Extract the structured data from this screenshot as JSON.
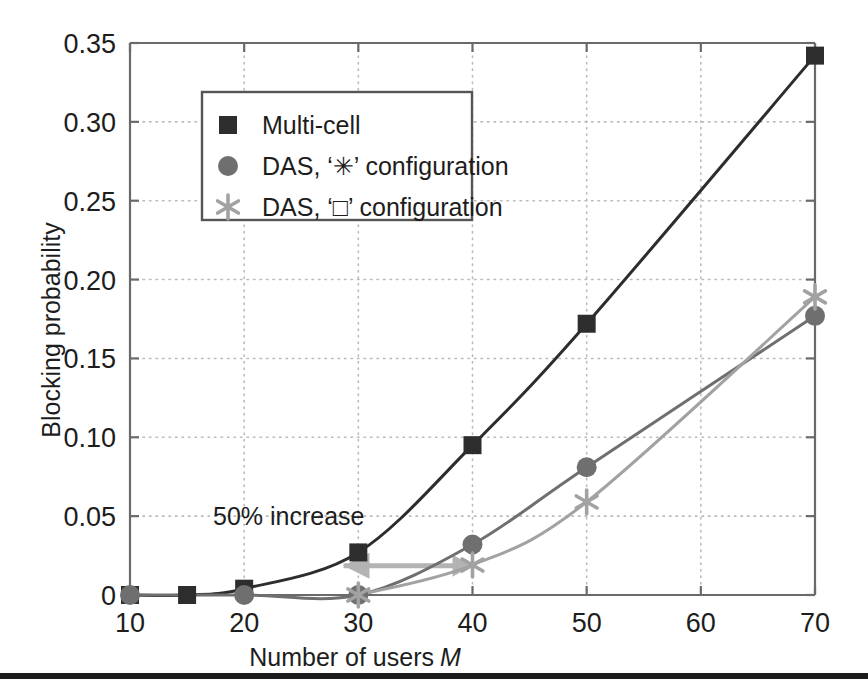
{
  "chart_data": {
    "type": "line",
    "title": "",
    "subtitle": "",
    "xlabel": "Number of users",
    "xlabel_symbol": "M",
    "ylabel": "Blocking probability",
    "xlim": [
      10,
      70
    ],
    "ylim": [
      0,
      0.35
    ],
    "grid": true,
    "grid_style": "dotted",
    "x_ticks": [
      10,
      20,
      30,
      40,
      50,
      60,
      70
    ],
    "x_tick_labels": [
      "10",
      "20",
      "30",
      "40",
      "50",
      "60",
      "70"
    ],
    "y_ticks": [
      0,
      0.05,
      0.1,
      0.15,
      0.2,
      0.25,
      0.3,
      0.35
    ],
    "y_tick_labels": [
      "0",
      "0.05",
      "0.10",
      "0.15",
      "0.20",
      "0.25",
      "0.30",
      "0.35"
    ],
    "legend_position": "upper-left-inset",
    "series": [
      {
        "name": "Multi-cell",
        "marker": "square",
        "color": "#2d2d2d",
        "x": [
          10,
          15,
          20,
          30,
          40,
          50,
          70
        ],
        "values": [
          0.0,
          0.0,
          0.004,
          0.027,
          0.095,
          0.172,
          0.342
        ]
      },
      {
        "name": "DAS, '✳' configuration",
        "marker": "circle",
        "color": "#6f6f6f",
        "x": [
          10,
          20,
          30,
          40,
          50,
          70
        ],
        "values": [
          0.0,
          0.0,
          0.0,
          0.032,
          0.081,
          0.177
        ]
      },
      {
        "name": "DAS, '□' configuration",
        "marker": "asterisk",
        "color": "#a2a2a2",
        "x": [
          30,
          40,
          50,
          70
        ],
        "values": [
          0.0,
          0.019,
          0.059,
          0.189
        ]
      }
    ],
    "annotations": [
      {
        "text": "50% increase",
        "x": 22.2,
        "y": 0.049,
        "arrow": {
          "type": "double-headed-horizontal",
          "x_start": 40,
          "x_end": 28.7,
          "y": 0.0185,
          "color": "#b3b3b3"
        }
      }
    ]
  },
  "legend": {
    "entries": [
      {
        "label": "Multi-cell",
        "marker": "square",
        "color": "#2d2d2d"
      },
      {
        "label": "DAS, ‘✳’ configuration",
        "marker": "circle",
        "color": "#6f6f6f"
      },
      {
        "label": "DAS, ‘□’ configuration",
        "marker": "asterisk",
        "color": "#a2a2a2"
      }
    ]
  },
  "axes": {
    "y_title": "Blocking probability",
    "x_title": "Number of users",
    "x_title_symbol": "M",
    "y_labels": [
      "0.35",
      "0.30",
      "0.25",
      "0.20",
      "0.15",
      "0.10",
      "0.05",
      "0"
    ],
    "x_labels": [
      "10",
      "20",
      "30",
      "40",
      "50",
      "60",
      "70"
    ]
  },
  "annotation": {
    "increase_label": "50% increase"
  },
  "colors": {
    "axis": "#6a6a6a",
    "grid": "#bbbbbb",
    "series_multicell": "#2d2d2d",
    "series_das_star": "#6f6f6f",
    "series_das_square": "#a2a2a2",
    "arrow": "#b3b3b3",
    "bottom_rule": "#1c1c1c"
  }
}
